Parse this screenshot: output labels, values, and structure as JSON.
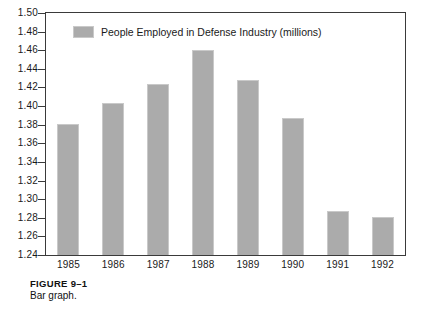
{
  "figure": {
    "caption_title": "FIGURE 9–1",
    "caption_text": "Bar graph."
  },
  "legend": {
    "swatch_color": "#ababab",
    "label": "People Employed in Defense Industry (millions)"
  },
  "axes": {
    "y_tick_labels": [
      "1.50",
      "1.48",
      "1.46",
      "1.44",
      "1.42",
      "1.40",
      "1.38",
      "1.36",
      "1.34",
      "1.32",
      "1.30",
      "1.28",
      "1.26",
      "1.24"
    ],
    "x_tick_labels": [
      "1985",
      "1986",
      "1987",
      "1988",
      "1989",
      "1990",
      "1991",
      "1992"
    ]
  },
  "chart_data": {
    "type": "bar",
    "title": "",
    "subtitle": "",
    "xlabel": "",
    "ylabel": "",
    "categories": [
      "1985",
      "1986",
      "1987",
      "1988",
      "1989",
      "1990",
      "1991",
      "1992"
    ],
    "values": [
      1.381,
      1.403,
      1.424,
      1.46,
      1.428,
      1.387,
      1.287,
      1.281
    ],
    "series": [
      {
        "name": "People Employed in Defense Industry (millions)",
        "color": "#ababab",
        "values": [
          1.381,
          1.403,
          1.424,
          1.46,
          1.428,
          1.387,
          1.287,
          1.281
        ]
      }
    ],
    "ylim": [
      1.24,
      1.5
    ],
    "ytick_step": 0.02,
    "yticks": [
      1.24,
      1.26,
      1.28,
      1.3,
      1.32,
      1.34,
      1.36,
      1.38,
      1.4,
      1.42,
      1.44,
      1.46,
      1.48,
      1.5
    ],
    "grid": false,
    "legend_position": "top-left-inside",
    "bar_color": "#ababab",
    "frame_color": "#3a3a3a",
    "background": "#ffffff"
  }
}
